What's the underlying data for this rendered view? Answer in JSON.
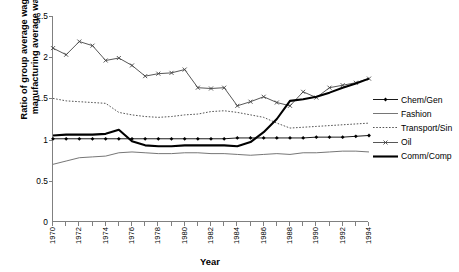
{
  "chart_data": {
    "type": "line",
    "title": "",
    "xlabel": "Year",
    "ylabel": "Ratio of group average wage to manufacturing average wage",
    "ylabel_line1": "Ratio of group average wage to",
    "ylabel_line2": "manufacturing average wage",
    "xlim": [
      1970,
      1994
    ],
    "ylim": [
      0,
      2.5
    ],
    "ytick_labels": [
      "0",
      "0.5",
      "1",
      "1.5",
      "2",
      "2.5"
    ],
    "ytick_values": [
      0,
      0.5,
      1,
      1.5,
      2,
      2.5
    ],
    "x": [
      1970,
      1971,
      1972,
      1973,
      1974,
      1975,
      1976,
      1977,
      1978,
      1979,
      1980,
      1981,
      1982,
      1983,
      1984,
      1985,
      1986,
      1987,
      1988,
      1989,
      1990,
      1991,
      1992,
      1993,
      1994
    ],
    "xtick_labels": [
      "1970",
      "1972",
      "1974",
      "1976",
      "1978",
      "1980",
      "1982",
      "1984",
      "1986",
      "1988",
      "1990",
      "1992",
      "1994"
    ],
    "xtick_values": [
      1970,
      1972,
      1974,
      1976,
      1978,
      1980,
      1982,
      1984,
      1986,
      1988,
      1990,
      1992,
      1994
    ],
    "grid": false,
    "legend_position": "right",
    "series": [
      {
        "name": "Chem/Gen",
        "marker": "diamond",
        "style": "solid-thin-marker",
        "color": "#000000",
        "values": [
          1.01,
          1.01,
          1.01,
          1.01,
          1.01,
          1.01,
          1.01,
          1.01,
          1.01,
          1.01,
          1.01,
          1.01,
          1.01,
          1.01,
          1.02,
          1.02,
          1.02,
          1.02,
          1.02,
          1.02,
          1.03,
          1.03,
          1.03,
          1.04,
          1.05
        ]
      },
      {
        "name": "Fashion",
        "marker": "none",
        "style": "solid-thin",
        "color": "#666666",
        "values": [
          0.7,
          0.74,
          0.78,
          0.79,
          0.8,
          0.84,
          0.85,
          0.84,
          0.83,
          0.83,
          0.84,
          0.84,
          0.83,
          0.83,
          0.82,
          0.81,
          0.82,
          0.83,
          0.82,
          0.84,
          0.84,
          0.85,
          0.86,
          0.86,
          0.85
        ]
      },
      {
        "name": "Transport/Sin",
        "marker": "none",
        "style": "dotted",
        "color": "#555555",
        "values": [
          1.5,
          1.47,
          1.46,
          1.45,
          1.44,
          1.33,
          1.3,
          1.28,
          1.27,
          1.28,
          1.3,
          1.31,
          1.34,
          1.35,
          1.33,
          1.3,
          1.27,
          1.2,
          1.14,
          1.15,
          1.16,
          1.17,
          1.18,
          1.19,
          1.2
        ]
      },
      {
        "name": "Oil",
        "marker": "x",
        "style": "solid-thin-marker",
        "color": "#444444",
        "values": [
          2.11,
          2.03,
          2.19,
          2.14,
          1.96,
          1.99,
          1.9,
          1.77,
          1.8,
          1.81,
          1.85,
          1.63,
          1.62,
          1.63,
          1.41,
          1.46,
          1.52,
          1.45,
          1.41,
          1.58,
          1.51,
          1.63,
          1.66,
          1.69,
          1.74
        ]
      },
      {
        "name": "Comm/Comp",
        "marker": "none",
        "style": "solid-thick",
        "color": "#000000",
        "values": [
          1.05,
          1.06,
          1.06,
          1.06,
          1.07,
          1.12,
          0.98,
          0.93,
          0.92,
          0.92,
          0.93,
          0.93,
          0.93,
          0.93,
          0.92,
          0.97,
          1.09,
          1.25,
          1.47,
          1.49,
          1.52,
          1.57,
          1.63,
          1.68,
          1.74
        ]
      }
    ]
  },
  "legend": {
    "items": [
      {
        "label": "Chem/Gen"
      },
      {
        "label": "Fashion"
      },
      {
        "label": "Transport/Sin"
      },
      {
        "label": "Oil"
      },
      {
        "label": "Comm/Comp"
      }
    ]
  }
}
